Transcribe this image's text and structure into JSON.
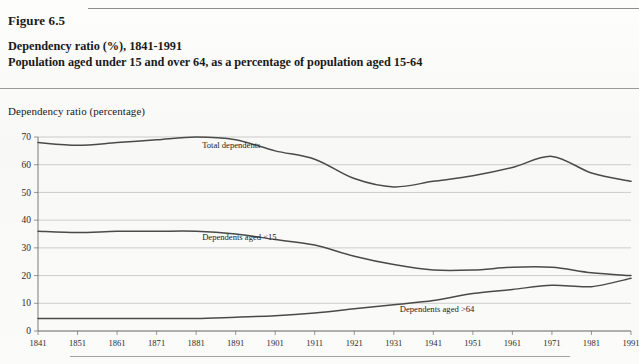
{
  "figure": {
    "label": "Figure 6.5",
    "title_line1": "Dependency ratio (%), 1841-1991",
    "title_line2": "Population aged under 15 and over 64, as a percentage of population aged 15-64"
  },
  "chart_data": {
    "type": "line",
    "title": "Dependency ratio (%), 1841-1991",
    "subtitle": "Population aged under 15 and over 64, as a percentage of population aged 15-64",
    "xlabel": "",
    "ylabel": "Dependency ratio (percentage)",
    "ylim": [
      0,
      70
    ],
    "xlim": [
      1841,
      1991
    ],
    "yticks": [
      0,
      10,
      20,
      30,
      40,
      50,
      60,
      70
    ],
    "ytick_labels": [
      "0",
      "10",
      "20",
      "30",
      "40",
      "50",
      "60",
      "70"
    ],
    "grid": true,
    "grid_axis": "y",
    "legend": "inline-annotations",
    "x": [
      1841,
      1851,
      1861,
      1871,
      1881,
      1891,
      1901,
      1911,
      1921,
      1931,
      1941,
      1951,
      1961,
      1971,
      1981,
      1991
    ],
    "xtick_labels": [
      "1841",
      "1851",
      "1861",
      "1871",
      "1881",
      "1891",
      "1901",
      "1911",
      "1921",
      "1931",
      "1941",
      "1951",
      "1961",
      "1971",
      "1981",
      "1991"
    ],
    "series": [
      {
        "name": "Total dependents",
        "values": [
          68,
          67,
          68,
          69,
          70,
          69,
          65,
          62,
          55,
          52,
          54,
          56,
          59,
          63,
          57,
          54
        ],
        "annotation_x": 1881,
        "annotation_y": 66
      },
      {
        "name": "Dependents aged <15",
        "values": [
          36,
          35.5,
          36,
          36,
          36,
          35,
          33,
          31,
          27,
          24,
          22,
          22,
          23,
          23,
          21,
          20
        ],
        "annotation_x": 1881,
        "annotation_y": 33
      },
      {
        "name": "Dependents aged >64",
        "values": [
          4.5,
          4.5,
          4.5,
          4.5,
          4.5,
          5,
          5.5,
          6.5,
          8,
          9.5,
          11,
          13.5,
          15,
          16.5,
          16,
          19
        ],
        "annotation_x": 1931,
        "annotation_y": 7
      }
    ]
  },
  "series_labels": {
    "total": "Total dependents",
    "under15": "Dependents aged <15",
    "over64": "Dependents aged >64"
  }
}
